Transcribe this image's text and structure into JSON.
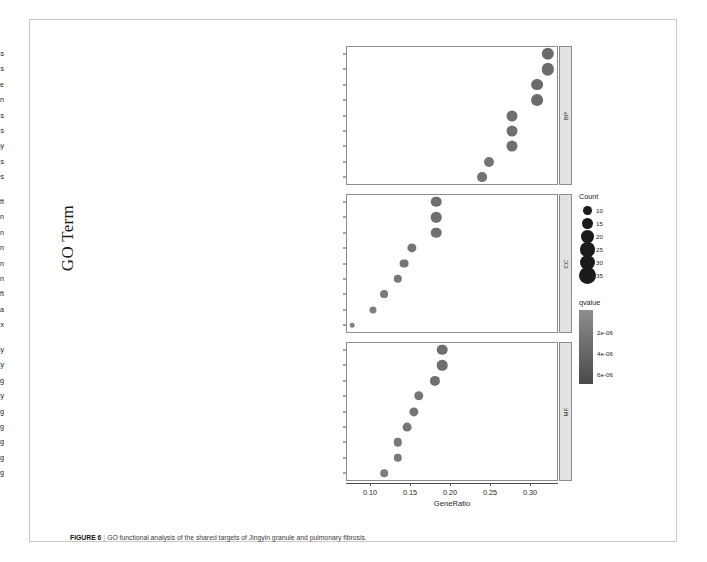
{
  "figure": {
    "caption_label": "FIGURE 6",
    "caption_separator": "|",
    "caption_text": "GO functional analysis of the shared targets of Jingyin granule and pulmonary fibrosis."
  },
  "axes": {
    "x_title": "GeneRatio",
    "y_title": "GO Term",
    "x_ticks": [
      "0.10",
      "0.15",
      "0.20",
      "0.25",
      "0.30"
    ],
    "x_tick_values": [
      0.1,
      0.15,
      0.2,
      0.25,
      0.3
    ],
    "x_min": 0.07,
    "x_max": 0.335
  },
  "legends": {
    "count": {
      "title": "Count",
      "items": [
        {
          "label": "10",
          "size": 4.4
        },
        {
          "label": "15",
          "size": 5.4
        },
        {
          "label": "20",
          "size": 6.3
        },
        {
          "label": "25",
          "size": 7.1
        },
        {
          "label": "30",
          "size": 7.8
        },
        {
          "label": "35",
          "size": 8.6
        }
      ]
    },
    "qvalue": {
      "title": "qvalue",
      "ticks": [
        "2e-06",
        "4e-06",
        "6e-06"
      ],
      "tick_values": [
        2e-06,
        4e-06,
        6e-06
      ],
      "color_low": "#8d8d8d",
      "color_high": "#4a4a4a"
    }
  },
  "chart_data": {
    "type": "scatter",
    "title": "",
    "xlabel": "GeneRatio",
    "ylabel": "GO Term",
    "xlim": [
      0.07,
      0.335
    ],
    "grid": false,
    "legend_position": "right",
    "facets": [
      {
        "strip_label": "BP",
        "name": "Biological Process",
        "points": [
          {
            "term": "cellular response to chemical stress",
            "gene_ratio": 0.322,
            "count": 35,
            "qvalue": 1e-06,
            "color": "#6b6b6b",
            "radius": 6.2
          },
          {
            "term": "response to oxidative stress",
            "gene_ratio": 0.322,
            "count": 35,
            "qvalue": 1.2e-06,
            "color": "#6b6b6b",
            "radius": 6.2
          },
          {
            "term": "response to lipopolysaccharide",
            "gene_ratio": 0.309,
            "count": 33,
            "qvalue": 1.5e-06,
            "color": "#6b6b6b",
            "radius": 5.9
          },
          {
            "term": "response to molecule of bacterial origin",
            "gene_ratio": 0.309,
            "count": 33,
            "qvalue": 1.8e-06,
            "color": "#6b6b6b",
            "radius": 5.9
          },
          {
            "term": "reactive oxygen species metabolic process",
            "gene_ratio": 0.277,
            "count": 29,
            "qvalue": 2.2e-06,
            "color": "#6f6f6f",
            "radius": 5.5
          },
          {
            "term": "cellular response to oxidative stress",
            "gene_ratio": 0.277,
            "count": 29,
            "qvalue": 2.4e-06,
            "color": "#6f6f6f",
            "radius": 5.5
          },
          {
            "term": "regulation of apoptotic signaling pathway",
            "gene_ratio": 0.277,
            "count": 29,
            "qvalue": 2.6e-06,
            "color": "#6f6f6f",
            "radius": 5.5
          },
          {
            "term": "regulation of reactive oxygen species metabolic process",
            "gene_ratio": 0.249,
            "count": 25,
            "qvalue": 3e-06,
            "color": "#737373",
            "radius": 5.0
          },
          {
            "term": "response to reactive oxygen species",
            "gene_ratio": 0.24,
            "count": 24,
            "qvalue": 3.4e-06,
            "color": "#737373",
            "radius": 4.9
          }
        ]
      },
      {
        "strip_label": "CC",
        "name": "Cellular Component",
        "points": [
          {
            "term": "membrane raft",
            "gene_ratio": 0.183,
            "count": 20,
            "qvalue": 2e-06,
            "color": "#6f6f6f",
            "radius": 5.3
          },
          {
            "term": "membrane microdomain",
            "gene_ratio": 0.183,
            "count": 20,
            "qvalue": 2.1e-06,
            "color": "#6f6f6f",
            "radius": 5.3
          },
          {
            "term": "membrane region",
            "gene_ratio": 0.183,
            "count": 20,
            "qvalue": 2.2e-06,
            "color": "#6f6f6f",
            "radius": 5.3
          },
          {
            "term": "vesicle lumen",
            "gene_ratio": 0.152,
            "count": 16,
            "qvalue": 3.2e-06,
            "color": "#757575",
            "radius": 4.6
          },
          {
            "term": "cytoplasmic vesicle lumen",
            "gene_ratio": 0.143,
            "count": 15,
            "qvalue": 3.6e-06,
            "color": "#757575",
            "radius": 4.4
          },
          {
            "term": "secretory granule lumen",
            "gene_ratio": 0.135,
            "count": 14,
            "qvalue": 4e-06,
            "color": "#787878",
            "radius": 4.2
          },
          {
            "term": "plasma membrane raft",
            "gene_ratio": 0.118,
            "count": 12,
            "qvalue": 4.8e-06,
            "color": "#7c7c7c",
            "radius": 3.9
          },
          {
            "term": "caveola",
            "gene_ratio": 0.104,
            "count": 10,
            "qvalue": 5.6e-06,
            "color": "#7f7f7f",
            "radius": 3.5
          },
          {
            "term": "RNA polymerase II transcription regulator complex",
            "gene_ratio": 0.078,
            "count": 7,
            "qvalue": 7e-06,
            "color": "#848484",
            "radius": 2.3
          }
        ]
      },
      {
        "strip_label": "MF",
        "name": "Molecular Function",
        "points": [
          {
            "term": "receptor ligand activity",
            "gene_ratio": 0.19,
            "count": 21,
            "qvalue": 2.2e-06,
            "color": "#6f6f6f",
            "radius": 5.3
          },
          {
            "term": "signaling receptor activator activity",
            "gene_ratio": 0.19,
            "count": 21,
            "qvalue": 2.3e-06,
            "color": "#6f6f6f",
            "radius": 5.3
          },
          {
            "term": "cytokine receptor binding",
            "gene_ratio": 0.181,
            "count": 20,
            "qvalue": 2.6e-06,
            "color": "#717171",
            "radius": 5.1
          },
          {
            "term": "cytokine activity",
            "gene_ratio": 0.161,
            "count": 17,
            "qvalue": 3.2e-06,
            "color": "#757575",
            "radius": 4.7
          },
          {
            "term": "DNA-binding transcription factor binding",
            "gene_ratio": 0.155,
            "count": 16,
            "qvalue": 3.5e-06,
            "color": "#757575",
            "radius": 4.6
          },
          {
            "term": "phosphatase binding",
            "gene_ratio": 0.146,
            "count": 15,
            "qvalue": 3.9e-06,
            "color": "#777777",
            "radius": 4.4
          },
          {
            "term": "RNA polymerase II-specific DNA-binding transcription factor binding",
            "gene_ratio": 0.135,
            "count": 14,
            "qvalue": 4.4e-06,
            "color": "#797979",
            "radius": 4.2
          },
          {
            "term": "ubiquitin-like protein ligase binding",
            "gene_ratio": 0.135,
            "count": 14,
            "qvalue": 4.6e-06,
            "color": "#797979",
            "radius": 4.2
          },
          {
            "term": "protein phosphatase binding",
            "gene_ratio": 0.118,
            "count": 12,
            "qvalue": 5.4e-06,
            "color": "#7d7d7d",
            "radius": 3.8
          }
        ]
      }
    ]
  }
}
